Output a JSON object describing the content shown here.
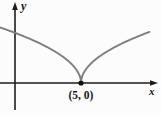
{
  "labels": {
    "x_axis": "x",
    "y_axis": "y",
    "cusp_point": "(5, 0)"
  },
  "colors": {
    "background": "#fcfcfc",
    "axis": "#1c1c1c",
    "curve": "#7d7d7d",
    "point": "#111111"
  },
  "chart_data": {
    "type": "line",
    "title": "",
    "xlabel": "x",
    "ylabel": "y",
    "grid": false,
    "legend": false,
    "function": "y = k*sqrt(|x - 5|) with k ~ 1.7, cusp at (5, 0)",
    "coefficient": 1.7,
    "cusp": {
      "x": 5,
      "y": 0
    },
    "x_range": [
      -1.1,
      10.2
    ],
    "points": [
      [
        -1,
        4.2
      ],
      [
        0,
        3.8
      ],
      [
        1,
        3.4
      ],
      [
        2,
        2.95
      ],
      [
        3,
        2.4
      ],
      [
        4,
        1.7
      ],
      [
        5,
        0
      ],
      [
        6,
        1.7
      ],
      [
        7,
        2.4
      ],
      [
        8,
        2.95
      ],
      [
        9,
        3.4
      ],
      [
        10,
        3.8
      ]
    ],
    "marked_points": [
      {
        "x": 5,
        "y": 0,
        "label": "(5, 0)"
      }
    ],
    "annotations": [
      {
        "text": "(5, 0)",
        "x": 5,
        "y": 0
      }
    ]
  }
}
